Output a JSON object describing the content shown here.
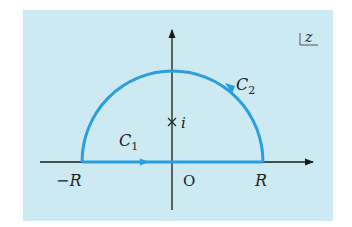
{
  "diagram": {
    "plane_label": "z",
    "colors": {
      "background": "#cdeaf3",
      "contour": "#2a9ee0",
      "axis": "#1a1a1a"
    },
    "labels": {
      "neg_r": "−R",
      "origin": "O",
      "pos_r": "R",
      "c1": "C",
      "c1_sub": "1",
      "c2": "C",
      "c2_sub": "2",
      "pole": "i"
    },
    "contours": [
      {
        "name": "C1",
        "description": "straight segment along the real axis from −R to R"
      },
      {
        "name": "C2",
        "description": "semicircular arc of radius R in the upper half-plane"
      }
    ],
    "marked_points": [
      {
        "label": "i",
        "marker": "cross",
        "position": "on imaginary axis inside contour"
      }
    ]
  }
}
